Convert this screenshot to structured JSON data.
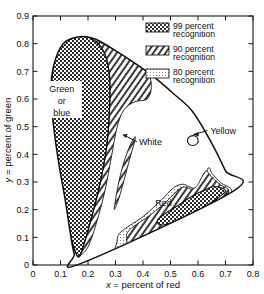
{
  "chart_data": {
    "type": "scatter",
    "title": "",
    "subtitle": "",
    "xlabel": "x = percent of red",
    "ylabel": "y = percent of green",
    "xlim": [
      0,
      0.8
    ],
    "ylim": [
      0,
      0.9
    ],
    "xticks": [
      "0",
      "0.1",
      "0.2",
      "0.3",
      "0.4",
      "0.5",
      "0.6",
      "0.7",
      "0.8"
    ],
    "xtick_values": [
      0,
      0.1,
      0.2,
      0.3,
      0.4,
      0.5,
      0.6,
      0.7,
      0.8
    ],
    "yticks": [
      "0",
      "0.1",
      "0.2",
      "0.3",
      "0.4",
      "0.5",
      "0.6",
      "0.7",
      "0.8",
      "0.9"
    ],
    "ytick_values": [
      0,
      0.1,
      0.2,
      0.3,
      0.4,
      0.5,
      0.6,
      0.7,
      0.8,
      0.9
    ],
    "grid": false,
    "legend_position": "top-right",
    "legend": [
      {
        "key": "99-percent",
        "label_line1": "99 percent",
        "label_line2": "recognition",
        "pattern": "cross-hatch"
      },
      {
        "key": "90-percent",
        "label_line1": "90 percent",
        "label_line2": "recognition",
        "pattern": "diagonal-hatch"
      },
      {
        "key": "80-percent",
        "label_line1": "80 percent",
        "label_line2": "recognition",
        "pattern": "fine-dots"
      }
    ],
    "annotations": [
      {
        "key": "green-or-blue",
        "text_line1": "Green",
        "text_line2": "or",
        "text_line3": "blue",
        "x": 0.105,
        "y": 0.6,
        "boxed": true
      },
      {
        "key": "white",
        "text": "White",
        "x": 0.385,
        "y": 0.435,
        "leader": true
      },
      {
        "key": "yellow",
        "text": "Yellow",
        "x": 0.645,
        "y": 0.475,
        "leader": true
      },
      {
        "key": "red",
        "text": "Red",
        "x": 0.475,
        "y": 0.215,
        "leader": false
      }
    ],
    "series": [
      {
        "name": "spectral-locus",
        "description": "CIE horseshoe outline of all visible chromaticities",
        "points": [
          [
            0.173,
            0.005
          ],
          [
            0.15,
            0.04
          ],
          [
            0.135,
            0.12
          ],
          [
            0.118,
            0.23
          ],
          [
            0.095,
            0.36
          ],
          [
            0.075,
            0.5
          ],
          [
            0.065,
            0.62
          ],
          [
            0.075,
            0.72
          ],
          [
            0.11,
            0.8
          ],
          [
            0.17,
            0.825
          ],
          [
            0.23,
            0.815
          ],
          [
            0.3,
            0.775
          ],
          [
            0.37,
            0.73
          ],
          [
            0.44,
            0.68
          ],
          [
            0.51,
            0.62
          ],
          [
            0.58,
            0.555
          ],
          [
            0.65,
            0.44
          ],
          [
            0.7,
            0.34
          ],
          [
            0.73,
            0.268
          ],
          [
            0.173,
            0.005
          ]
        ]
      },
      {
        "name": "green-99-percent",
        "description": "99 percent recognition region for green or blue",
        "points": [
          [
            0.163,
            0.03
          ],
          [
            0.13,
            0.13
          ],
          [
            0.105,
            0.26
          ],
          [
            0.085,
            0.4
          ],
          [
            0.07,
            0.54
          ],
          [
            0.068,
            0.66
          ],
          [
            0.082,
            0.76
          ],
          [
            0.12,
            0.81
          ],
          [
            0.175,
            0.828
          ],
          [
            0.228,
            0.808
          ],
          [
            0.262,
            0.76
          ],
          [
            0.278,
            0.68
          ],
          [
            0.278,
            0.56
          ],
          [
            0.268,
            0.43
          ],
          [
            0.245,
            0.3
          ],
          [
            0.215,
            0.18
          ],
          [
            0.188,
            0.085
          ],
          [
            0.163,
            0.03
          ]
        ]
      },
      {
        "name": "green-90-percent",
        "description": "90 percent recognition band surrounding the green 99 percent region",
        "points": [
          [
            0.163,
            0.03
          ],
          [
            0.188,
            0.085
          ],
          [
            0.215,
            0.18
          ],
          [
            0.245,
            0.3
          ],
          [
            0.268,
            0.43
          ],
          [
            0.278,
            0.56
          ],
          [
            0.278,
            0.68
          ],
          [
            0.262,
            0.76
          ],
          [
            0.228,
            0.808
          ],
          [
            0.3,
            0.775
          ],
          [
            0.37,
            0.73
          ],
          [
            0.42,
            0.69
          ],
          [
            0.43,
            0.64
          ],
          [
            0.415,
            0.6
          ],
          [
            0.37,
            0.59
          ],
          [
            0.33,
            0.56
          ],
          [
            0.305,
            0.495
          ],
          [
            0.285,
            0.39
          ],
          [
            0.262,
            0.27
          ],
          [
            0.23,
            0.15
          ],
          [
            0.198,
            0.062
          ],
          [
            0.163,
            0.03
          ]
        ]
      },
      {
        "name": "white-90-percent",
        "description": "90 percent recognition sliver for white",
        "points": [
          [
            0.368,
            0.46
          ],
          [
            0.352,
            0.43
          ],
          [
            0.33,
            0.37
          ],
          [
            0.312,
            0.3
          ],
          [
            0.3,
            0.235
          ],
          [
            0.296,
            0.2
          ],
          [
            0.312,
            0.24
          ],
          [
            0.332,
            0.31
          ],
          [
            0.352,
            0.385
          ],
          [
            0.368,
            0.44
          ],
          [
            0.372,
            0.462
          ],
          [
            0.368,
            0.46
          ]
        ]
      },
      {
        "name": "yellow-loop",
        "description": "small yellow recognition loop on the spectral locus",
        "points": [
          [
            0.572,
            0.465
          ],
          [
            0.562,
            0.452
          ],
          [
            0.566,
            0.438
          ],
          [
            0.582,
            0.432
          ],
          [
            0.598,
            0.44
          ],
          [
            0.6,
            0.454
          ],
          [
            0.59,
            0.466
          ],
          [
            0.572,
            0.465
          ]
        ]
      },
      {
        "name": "red-80-percent",
        "description": "80 percent recognition region for red",
        "points": [
          [
            0.318,
            0.118
          ],
          [
            0.4,
            0.175
          ],
          [
            0.47,
            0.238
          ],
          [
            0.512,
            0.28
          ],
          [
            0.545,
            0.292
          ],
          [
            0.57,
            0.282
          ],
          [
            0.592,
            0.278
          ],
          [
            0.612,
            0.3
          ],
          [
            0.628,
            0.33
          ],
          [
            0.64,
            0.352
          ],
          [
            0.652,
            0.33
          ],
          [
            0.682,
            0.298
          ],
          [
            0.722,
            0.272
          ],
          [
            0.7,
            0.24
          ],
          [
            0.64,
            0.192
          ],
          [
            0.56,
            0.14
          ],
          [
            0.47,
            0.092
          ],
          [
            0.39,
            0.058
          ],
          [
            0.33,
            0.04
          ],
          [
            0.3,
            0.05
          ],
          [
            0.305,
            0.082
          ],
          [
            0.318,
            0.118
          ]
        ]
      },
      {
        "name": "red-90-percent",
        "description": "90 percent recognition region for red",
        "points": [
          [
            0.352,
            0.128
          ],
          [
            0.428,
            0.182
          ],
          [
            0.492,
            0.236
          ],
          [
            0.528,
            0.272
          ],
          [
            0.552,
            0.282
          ],
          [
            0.578,
            0.274
          ],
          [
            0.598,
            0.288
          ],
          [
            0.614,
            0.318
          ],
          [
            0.63,
            0.34
          ],
          [
            0.646,
            0.322
          ],
          [
            0.678,
            0.292
          ],
          [
            0.712,
            0.27
          ],
          [
            0.688,
            0.24
          ],
          [
            0.628,
            0.196
          ],
          [
            0.552,
            0.152
          ],
          [
            0.47,
            0.112
          ],
          [
            0.4,
            0.082
          ],
          [
            0.352,
            0.072
          ],
          [
            0.34,
            0.095
          ],
          [
            0.352,
            0.128
          ]
        ]
      },
      {
        "name": "red-99-percent",
        "description": "99 percent recognition region for red",
        "points": [
          [
            0.47,
            0.178
          ],
          [
            0.528,
            0.216
          ],
          [
            0.572,
            0.245
          ],
          [
            0.604,
            0.262
          ],
          [
            0.628,
            0.272
          ],
          [
            0.648,
            0.282
          ],
          [
            0.672,
            0.282
          ],
          [
            0.7,
            0.268
          ],
          [
            0.672,
            0.242
          ],
          [
            0.62,
            0.208
          ],
          [
            0.56,
            0.178
          ],
          [
            0.5,
            0.152
          ],
          [
            0.462,
            0.145
          ],
          [
            0.452,
            0.16
          ],
          [
            0.47,
            0.178
          ]
        ]
      }
    ]
  }
}
